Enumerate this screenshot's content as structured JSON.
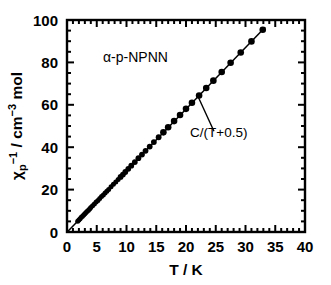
{
  "chart_data": {
    "type": "scatter",
    "title": "",
    "xlabel": "T / K",
    "ylabel": "χp−1 / cm−3 mol",
    "ylabel_parts": {
      "chi": "χ",
      "sub": "p",
      "sup": "−1",
      "mid": " / cm",
      "sup2": "−3",
      "tail": " mol"
    },
    "xlim": [
      0,
      40
    ],
    "ylim": [
      0,
      100
    ],
    "xticks": [
      0,
      5,
      10,
      15,
      20,
      25,
      30,
      35,
      40
    ],
    "yticks": [
      0,
      20,
      40,
      60,
      80,
      100
    ],
    "xtick_labels": [
      "0",
      "5",
      "10",
      "15",
      "20",
      "25",
      "30",
      "35",
      "40"
    ],
    "ytick_labels": [
      "0",
      "20",
      "40",
      "60",
      "80",
      "100"
    ],
    "x_minor_step": 1,
    "y_minor_step": 5,
    "grid": false,
    "legend": "none",
    "tick_direction": "in",
    "marker": "filled-circle",
    "marker_color": "#000000",
    "line_color": "#000000",
    "series": [
      {
        "name": "α-p-NPNN inverse susceptibility",
        "x": [
          1.8,
          2.0,
          2.2,
          2.4,
          2.6,
          2.8,
          3.0,
          3.2,
          3.4,
          3.6,
          3.8,
          4.0,
          4.3,
          4.6,
          4.9,
          5.2,
          5.5,
          5.8,
          6.1,
          6.4,
          6.7,
          7.0,
          7.4,
          7.8,
          8.2,
          8.6,
          9.0,
          9.4,
          9.8,
          10.3,
          10.8,
          11.4,
          12.0,
          12.6,
          13.2,
          13.9,
          14.6,
          15.4,
          16.2,
          17.0,
          18.0,
          19.0,
          20.0,
          21.0,
          22.2,
          23.4,
          24.6,
          26.0,
          27.5,
          29.2,
          31.0,
          32.9
        ],
        "y": [
          5.1,
          5.7,
          6.3,
          6.9,
          7.4,
          8.0,
          8.6,
          9.2,
          9.8,
          10.3,
          10.9,
          11.5,
          12.4,
          13.2,
          14.1,
          14.9,
          15.8,
          16.7,
          17.5,
          18.4,
          19.2,
          20.1,
          21.3,
          22.5,
          23.6,
          24.8,
          26.0,
          27.1,
          28.3,
          29.8,
          31.3,
          33.0,
          34.8,
          36.5,
          38.3,
          40.3,
          42.4,
          44.7,
          47.0,
          49.4,
          52.3,
          55.2,
          58.1,
          61.0,
          64.4,
          67.9,
          71.4,
          75.5,
          79.8,
          84.7,
          89.9,
          95.4
        ],
        "fit_label": "C/(T+0.5)",
        "fit_formula_C": 2.9,
        "fit_formula_theta": -0.5
      }
    ],
    "annotations": [
      {
        "id": "sample-label",
        "text": "α-p-NPNN",
        "x_data": 11.5,
        "y_data": 80.0
      },
      {
        "id": "fit-label",
        "text": "C/(T+0.5)",
        "x_data": 25.5,
        "y_data": 45.0,
        "leader_from": [
          22.0,
          64.0
        ],
        "leader_to": [
          24.7,
          47.5
        ]
      }
    ]
  }
}
